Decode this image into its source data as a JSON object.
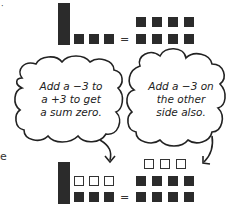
{
  "top_equation": {
    "left": {
      "x_bars": 1,
      "unit_tiles": 3
    },
    "equals": "=",
    "right": {
      "unit_tiles": 8
    }
  },
  "bubbles": [
    {
      "lines": [
        "Add a −3 to",
        "a +3 to get",
        "a sum zero."
      ]
    },
    {
      "lines": [
        "Add a −3 on",
        "the other",
        "side also."
      ]
    }
  ],
  "bottom_equation": {
    "left": {
      "x_bars": 1,
      "negative_tiles": 3,
      "unit_tiles": 3
    },
    "equals": "=",
    "right": {
      "negative_tiles": 3,
      "unit_tiles": 8
    }
  },
  "edge_fragment": "e",
  "colors": {
    "tile": "#2b2b2b",
    "outline": "#333333"
  }
}
